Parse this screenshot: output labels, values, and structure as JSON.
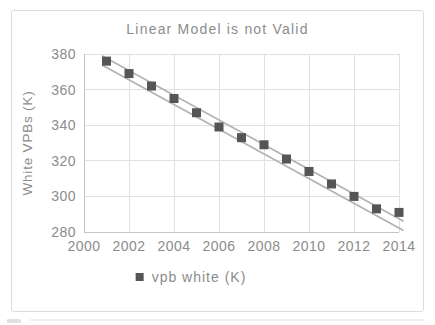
{
  "chart_data": {
    "type": "scatter",
    "title": "Linear Model is not Valid",
    "xlabel": "",
    "ylabel": "White VPBs (K)",
    "legend": [
      {
        "label": "vpb white (K)",
        "marker": "square"
      }
    ],
    "legend_position": "bottom",
    "grid": true,
    "xlim": [
      2000,
      2014
    ],
    "ylim": [
      280,
      380
    ],
    "xticks": [
      2000,
      2002,
      2004,
      2006,
      2008,
      2010,
      2012,
      2014
    ],
    "yticks": [
      280,
      300,
      320,
      340,
      360,
      380
    ],
    "x": [
      2001,
      2002,
      2003,
      2004,
      2005,
      2006,
      2007,
      2008,
      2009,
      2010,
      2011,
      2012,
      2013,
      2014
    ],
    "series": [
      {
        "name": "vpb white (K)",
        "values": [
          376,
          369,
          362,
          355,
          347,
          339,
          333,
          329,
          321,
          314,
          307,
          300,
          293,
          291
        ]
      }
    ],
    "band_lines": [
      {
        "x1": 2000.8,
        "y1": 379.0,
        "x2": 2014.2,
        "y2": 286.0
      },
      {
        "x1": 2000.8,
        "y1": 373.8,
        "x2": 2014.2,
        "y2": 280.8
      }
    ]
  },
  "colors": {
    "marker": "#555555",
    "band_line": "#b3b3b3",
    "gridline": "#e0e0e0",
    "axis_line": "#c4c4c4",
    "text": "#8c8c8c",
    "frame_border": "#dcdcdc",
    "background": "#ffffff"
  }
}
